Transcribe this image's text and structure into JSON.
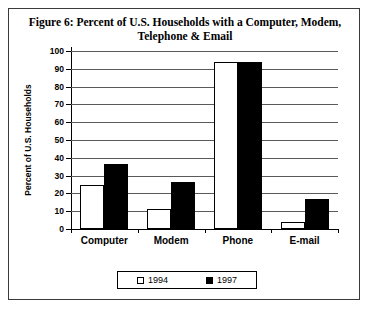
{
  "chart_data": {
    "type": "bar",
    "title": "Figure 6: Percent of U.S. Households with a Computer, Modem, Telephone & Email",
    "xlabel": "",
    "ylabel": "Percent of U.S. Households",
    "ylim": [
      0,
      100
    ],
    "ytick_step": 10,
    "grid": true,
    "legend_position": "bottom",
    "categories": [
      "Computer",
      "Modem",
      "Phone",
      "E-mail"
    ],
    "yticks": [
      "0",
      "10",
      "20",
      "30",
      "40",
      "50",
      "60",
      "70",
      "80",
      "90",
      "100"
    ],
    "series": [
      {
        "name": "1994",
        "color": "#ffffff",
        "values": [
          24.5,
          11,
          94,
          4
        ]
      },
      {
        "name": "1997",
        "color": "#000000",
        "values": [
          36.5,
          26.5,
          94,
          17
        ]
      }
    ]
  }
}
